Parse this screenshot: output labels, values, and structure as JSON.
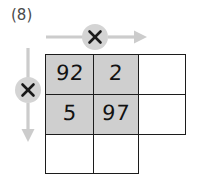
{
  "problem": {
    "label": "(8)"
  },
  "colors": {
    "arrow": "#cccccc",
    "badge_fill": "#d4d4d4",
    "badge_glyph": "#1a1a1a",
    "cell_border": "#1c1c1c",
    "cell_shaded_fill": "#cfcfcf",
    "cell_empty_fill": "#ffffff",
    "value_text": "#121212",
    "label_text": "#4a4a4a"
  },
  "operators": {
    "horizontal": {
      "symbol": "×",
      "icon": "multiply-icon",
      "direction": "right",
      "arrow_icon": "arrow-right-icon"
    },
    "vertical": {
      "symbol": "×",
      "icon": "multiply-icon",
      "direction": "down",
      "arrow_icon": "arrow-down-icon"
    }
  },
  "grid": {
    "rows": 3,
    "columns": 3,
    "missing_cells": [
      [
        2,
        2
      ]
    ],
    "cells": [
      [
        {
          "value": "92",
          "shaded": true,
          "empty": false
        },
        {
          "value": "2",
          "shaded": true,
          "empty": false
        },
        {
          "value": "",
          "shaded": false,
          "empty": true
        }
      ],
      [
        {
          "value": "5",
          "shaded": true,
          "empty": false
        },
        {
          "value": "97",
          "shaded": true,
          "empty": false
        },
        {
          "value": "",
          "shaded": false,
          "empty": true
        }
      ],
      [
        {
          "value": "",
          "shaded": false,
          "empty": true
        },
        {
          "value": "",
          "shaded": false,
          "empty": true
        }
      ]
    ]
  }
}
